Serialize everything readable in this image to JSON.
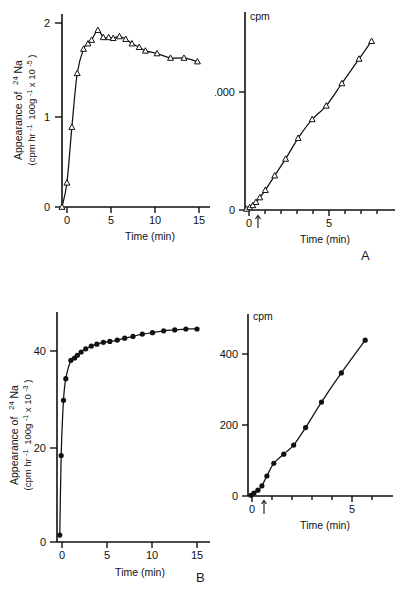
{
  "figure": {
    "panel_labels": [
      "A",
      "B"
    ],
    "axis_titles": {
      "time": "Time (min)",
      "cpm": "cpm",
      "appearance_line1": "Appearance of",
      "appearance_isotope_sup": "24",
      "appearance_isotope": "Na",
      "appearance_line2_a": "(cpm hr",
      "appearance_sup1": "-1",
      "appearance_line2_b": "100g",
      "appearance_sup2": "-1",
      "appearance_line2_c": " x 10",
      "appearance_sup3_top": "-5",
      "appearance_sup3_bottom": "-3"
    }
  },
  "chart_data": [
    {
      "id": "panel-a-left",
      "type": "scatter",
      "title": "",
      "xlabel": "Time (min)",
      "ylabel": "Appearance of 24Na (cpm hr-1 100g-1 x 10-5)",
      "xlim": [
        0,
        16.5
      ],
      "ylim": [
        0,
        2.15
      ],
      "xticks": [
        0,
        5,
        10,
        15
      ],
      "yticks": [
        0,
        1,
        2
      ],
      "xticklabels": [
        "0",
        "5",
        "10",
        "15"
      ],
      "yticklabels": [
        "0",
        "1",
        "2"
      ],
      "grid": false,
      "marker": "open-triangle",
      "x": [
        0.0,
        0.55,
        1.1,
        1.7,
        2.4,
        2.9,
        3.3,
        4.0,
        4.6,
        5.2,
        5.7,
        6.4,
        7.1,
        7.8,
        8.6,
        9.3,
        10.6,
        12.1,
        13.6,
        15.1
      ],
      "y": [
        0.0,
        0.27,
        0.89,
        1.49,
        1.76,
        1.82,
        1.86,
        1.97,
        1.89,
        1.89,
        1.88,
        1.9,
        1.87,
        1.82,
        1.78,
        1.74,
        1.71,
        1.66,
        1.66,
        1.62
      ]
    },
    {
      "id": "panel-a-right",
      "type": "scatter",
      "title": "cpm",
      "xlabel": "Time (min)",
      "ylabel": "cpm",
      "xlim": [
        0,
        9.6
      ],
      "ylim": [
        0,
        1900
      ],
      "xticks": [
        0,
        1,
        2,
        3,
        4,
        5,
        6,
        7,
        8
      ],
      "yticks": [
        0,
        1000
      ],
      "xticklabels": [
        "0",
        "5"
      ],
      "yticklabels": [
        "0",
        "1000"
      ],
      "grid": false,
      "marker": "open-triangle",
      "annotation_arrow_x": 0.55,
      "x": [
        0.1,
        0.3,
        0.5,
        0.7,
        0.95,
        1.3,
        1.9,
        2.6,
        3.4,
        4.3,
        5.2,
        6.2,
        7.3,
        8.1
      ],
      "y": [
        10,
        25,
        45,
        75,
        120,
        190,
        330,
        490,
        690,
        870,
        1000,
        1215,
        1450,
        1620
      ]
    },
    {
      "id": "panel-b-left",
      "type": "scatter",
      "title": "",
      "xlabel": "Time (min)",
      "ylabel": "Appearance of 24Na (cpm hr-1 100g-1 x 10-3)",
      "xlim": [
        0,
        16.5
      ],
      "ylim": [
        0,
        50
      ],
      "xticks": [
        0,
        5,
        10,
        15
      ],
      "yticks": [
        0,
        20,
        40
      ],
      "xticklabels": [
        "0",
        "5",
        "10",
        "15"
      ],
      "yticklabels": [
        "0",
        "20",
        "40"
      ],
      "grid": false,
      "marker": "filled-circle",
      "x": [
        0.3,
        0.45,
        0.7,
        0.95,
        1.5,
        1.9,
        2.2,
        2.6,
        3.1,
        3.7,
        4.3,
        5.0,
        5.7,
        6.5,
        7.3,
        8.2,
        9.2,
        10.3,
        11.5,
        12.7,
        13.9,
        15.1
      ],
      "y": [
        1.5,
        18.8,
        30.8,
        35.5,
        39.5,
        40.0,
        40.6,
        41.3,
        42.0,
        42.6,
        43.0,
        43.4,
        43.6,
        43.9,
        44.3,
        44.7,
        45.2,
        45.5,
        45.9,
        46.1,
        46.3,
        46.3
      ]
    },
    {
      "id": "panel-b-right",
      "type": "scatter",
      "title": "cpm",
      "xlabel": "Time (min)",
      "ylabel": "cpm",
      "xlim": [
        0,
        7.3
      ],
      "ylim": [
        0,
        500
      ],
      "xticks": [
        0,
        1,
        2,
        3,
        4,
        5,
        6
      ],
      "yticks": [
        0,
        200,
        400
      ],
      "xticklabels": [
        "0",
        "5"
      ],
      "yticklabels": [
        "0",
        "200",
        "400"
      ],
      "grid": false,
      "marker": "filled-circle",
      "annotation_arrow_x": 0.6,
      "x": [
        0.15,
        0.3,
        0.5,
        0.7,
        0.95,
        1.3,
        1.8,
        2.3,
        2.9,
        3.7,
        4.7,
        5.9
      ],
      "y": [
        2,
        8,
        16,
        28,
        55,
        90,
        115,
        140,
        188,
        258,
        338,
        428
      ]
    }
  ]
}
